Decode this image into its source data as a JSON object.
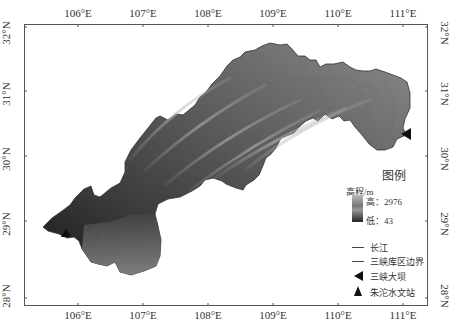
{
  "map": {
    "lon_labels": [
      "106°E",
      "107°E",
      "108°E",
      "109°E",
      "110°E",
      "111°E"
    ],
    "lat_labels": [
      "32°N",
      "31°N",
      "30°N",
      "29°N",
      "28°N"
    ]
  },
  "legend": {
    "title": "图例",
    "elevation_label": "高程/m",
    "high": "高：2976",
    "low": "低：43",
    "items": [
      {
        "label": "长江",
        "symbol": "line"
      },
      {
        "label": "三峡库区边界",
        "symbol": "line"
      },
      {
        "label": "三峡大坝",
        "symbol": "triangle-left"
      },
      {
        "label": "朱沱水文站",
        "symbol": "triangle-up"
      }
    ]
  },
  "colors": {
    "frame": "#555555",
    "terrain_high": "#bbbbbb",
    "terrain_low": "#222222",
    "marker": "#111111"
  }
}
